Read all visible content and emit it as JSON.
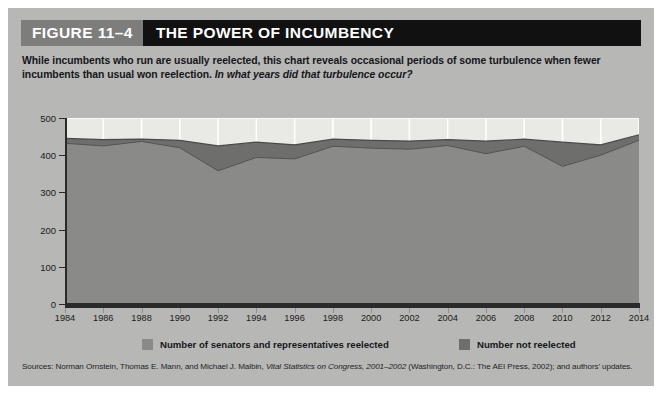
{
  "figure": {
    "number_label": "FIGURE 11–4",
    "title": "THE POWER OF INCUMBENCY",
    "subtitle_main": "While incumbents who run are usually reelected, this chart reveals occasional periods of some turbulence when fewer incumbents than usual won reelection.",
    "subtitle_question": "In what years did that turbulence occur?"
  },
  "source": {
    "prefix": "Sources: Norman Ornstein, Thomas E. Mann, and Michael J. Malbin, ",
    "italic_title": "Vital Statistics on Congress, 2001–2002",
    "suffix": " (Washington, D.C.: The AEI Press, 2002); and authors’ updates."
  },
  "colors": {
    "panel_bg": "#b7b7b5",
    "plot_bg": "#e9e9e6",
    "series_reelected": "#8a8a88",
    "series_not_reelected": "#6e6e6c",
    "axis": "#2a2a2a",
    "gridline": "#ffffff",
    "header_num_bg": "#7d7d7b",
    "header_title_bg": "#111111",
    "text": "#16171b"
  },
  "chart_data": {
    "type": "area",
    "stacked": true,
    "title": "THE POWER OF INCUMBENCY",
    "xlabel": "",
    "ylabel": "",
    "xlim": [
      1984,
      2014
    ],
    "ylim": [
      0,
      500
    ],
    "yticks": [
      0,
      100,
      200,
      300,
      400,
      500
    ],
    "ytick_labels": [
      "0",
      "100",
      "200",
      "300",
      "400",
      "500"
    ],
    "xticks": [
      1984,
      1986,
      1988,
      1990,
      1992,
      1994,
      1996,
      1998,
      2000,
      2002,
      2004,
      2006,
      2008,
      2010,
      2012,
      2014
    ],
    "xtick_labels": [
      "1984",
      "1986",
      "1988",
      "1990",
      "1992",
      "1994",
      "1996",
      "1998",
      "2000",
      "2002",
      "2004",
      "2006",
      "2008",
      "2010",
      "2012",
      "2014"
    ],
    "grid": true,
    "grid_axis": "both",
    "legend_position": "below",
    "x": [
      1984,
      1986,
      1988,
      1990,
      1992,
      1994,
      1996,
      1998,
      2000,
      2002,
      2004,
      2006,
      2008,
      2010,
      2012,
      2014
    ],
    "series": [
      {
        "name": "Number of senators and representatives reelected",
        "color": "#8a8a88",
        "values": [
          432,
          425,
          437,
          420,
          358,
          394,
          390,
          424,
          419,
          416,
          426,
          404,
          424,
          370,
          400,
          440
        ]
      },
      {
        "name": "Number not reelected",
        "color": "#6e6e6c",
        "values": [
          13,
          17,
          6,
          20,
          67,
          41,
          38,
          19,
          21,
          22,
          16,
          34,
          19,
          65,
          28,
          15
        ]
      }
    ],
    "totals": [
      445,
      442,
      443,
      440,
      425,
      435,
      428,
      443,
      440,
      438,
      442,
      438,
      443,
      435,
      428,
      455
    ],
    "legend": [
      "Number of senators and representatives reelected",
      "Number not reelected"
    ]
  }
}
